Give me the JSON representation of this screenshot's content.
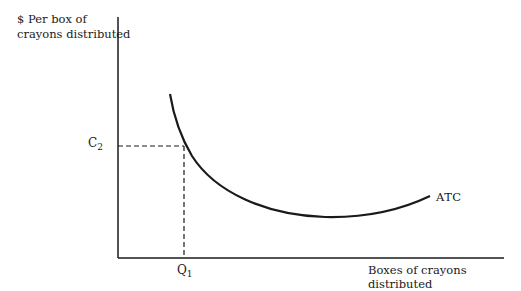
{
  "diagram": {
    "type": "economics-cost-curve",
    "y_axis_label_line1": "$ Per box of",
    "y_axis_label_line2": "crayons distributed",
    "x_axis_label": "Boxes of crayons distributed",
    "curve_label": "ATC",
    "y_marker": {
      "letter": "C",
      "subscript": "2"
    },
    "x_marker": {
      "letter": "Q",
      "subscript": "1"
    },
    "colors": {
      "ink": "#1a1a1a",
      "background": "#ffffff"
    }
  }
}
